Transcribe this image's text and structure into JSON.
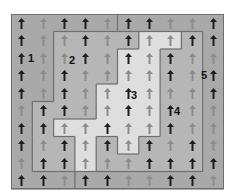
{
  "diagram": {
    "rows": 10,
    "cols": 10,
    "region_colors": {
      "1": "#a9a9a9",
      "2": "#b6b6b6",
      "3": "#dedede",
      "4": "#b6b6b6",
      "5": "#a9a9a9"
    },
    "border_color": "#6e6e6e",
    "arrow_colors": {
      "D": "#1e1e1e",
      "L": "#8c8c8c"
    },
    "regions": [
      [
        1,
        1,
        1,
        1,
        1,
        5,
        5,
        5,
        5,
        5
      ],
      [
        1,
        1,
        2,
        2,
        2,
        2,
        3,
        3,
        4,
        5
      ],
      [
        1,
        1,
        2,
        2,
        2,
        3,
        3,
        4,
        4,
        5
      ],
      [
        1,
        1,
        2,
        2,
        2,
        3,
        3,
        4,
        4,
        5
      ],
      [
        1,
        1,
        2,
        2,
        3,
        3,
        3,
        4,
        4,
        5
      ],
      [
        1,
        2,
        2,
        2,
        3,
        3,
        3,
        4,
        4,
        5
      ],
      [
        1,
        2,
        3,
        3,
        3,
        3,
        3,
        4,
        4,
        5
      ],
      [
        1,
        2,
        2,
        3,
        4,
        3,
        4,
        4,
        4,
        5
      ],
      [
        1,
        2,
        2,
        3,
        4,
        4,
        4,
        4,
        4,
        5
      ],
      [
        1,
        1,
        1,
        5,
        5,
        5,
        5,
        5,
        5,
        5
      ]
    ],
    "arrows": [
      [
        "D",
        "L",
        "D",
        "D",
        "L",
        "D",
        "D",
        "L",
        "L",
        "D"
      ],
      [
        "D",
        "L",
        "L",
        "D",
        "L",
        "D",
        "L",
        "L",
        "D",
        "D"
      ],
      [
        "D",
        "L",
        "L",
        "D",
        "L",
        "D",
        "L",
        "D",
        "L",
        "L"
      ],
      [
        "D",
        "L",
        "D",
        "L",
        "L",
        "L",
        "L",
        "D",
        "L",
        "D"
      ],
      [
        "D",
        "L",
        "D",
        "L",
        "L",
        "D",
        "L",
        "L",
        "L",
        "D"
      ],
      [
        "L",
        "D",
        "D",
        "L",
        "L",
        "D",
        "L",
        "D",
        "L",
        "L"
      ],
      [
        "D",
        "D",
        "L",
        "L",
        "D",
        "L",
        "L",
        "D",
        "L",
        "L"
      ],
      [
        "D",
        "L",
        "D",
        "L",
        "D",
        "L",
        "D",
        "L",
        "D",
        "L"
      ],
      [
        "L",
        "D",
        "D",
        "L",
        "L",
        "L",
        "D",
        "D",
        "D",
        "D"
      ],
      [
        "D",
        "D",
        "L",
        "D",
        "D",
        "L",
        "L",
        "D",
        "D",
        "L"
      ]
    ],
    "arrow_direction": "up",
    "labels": [
      {
        "text": "1",
        "x": 20,
        "y": 45
      },
      {
        "text": "2",
        "x": 61,
        "y": 47
      },
      {
        "text": "3",
        "x": 123,
        "y": 82
      },
      {
        "text": "4",
        "x": 166,
        "y": 98
      },
      {
        "text": "5",
        "x": 193,
        "y": 62
      }
    ]
  }
}
